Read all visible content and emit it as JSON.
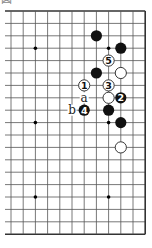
{
  "caption": "図",
  "board": {
    "columns": 12,
    "rows": 19,
    "origin_x": 11,
    "origin_y": 11,
    "spacing_x": 12.2,
    "spacing_y": 12.4,
    "left_open": true,
    "top_edge": true,
    "right_edge": true,
    "bottom_edge": true,
    "colors": {
      "line": "#555555",
      "edge": "#333333",
      "black": "#111111",
      "white": "#ffffff",
      "stone_outline": "#222222"
    },
    "star_points": [
      [
        2,
        3
      ],
      [
        8,
        3
      ],
      [
        2,
        9
      ],
      [
        8,
        9
      ],
      [
        2,
        15
      ],
      [
        8,
        15
      ]
    ],
    "stones": [
      {
        "color": "black",
        "c": 7,
        "r": 2,
        "label": ""
      },
      {
        "color": "black",
        "c": 9,
        "r": 3,
        "label": ""
      },
      {
        "color": "white",
        "c": 8,
        "r": 4,
        "label": "5"
      },
      {
        "color": "black",
        "c": 7,
        "r": 5,
        "label": ""
      },
      {
        "color": "white",
        "c": 9,
        "r": 5,
        "label": ""
      },
      {
        "color": "white",
        "c": 6,
        "r": 6,
        "label": "1"
      },
      {
        "color": "white",
        "c": 8,
        "r": 6,
        "label": "3"
      },
      {
        "color": "white",
        "c": 8,
        "r": 7,
        "label": ""
      },
      {
        "color": "black",
        "c": 9,
        "r": 7,
        "label": "2"
      },
      {
        "color": "black",
        "c": 6,
        "r": 8,
        "label": "4"
      },
      {
        "color": "black",
        "c": 8,
        "r": 8,
        "label": ""
      },
      {
        "color": "black",
        "c": 9,
        "r": 9,
        "label": ""
      },
      {
        "color": "white",
        "c": 9,
        "r": 11,
        "label": ""
      }
    ],
    "letters": [
      {
        "c": 6,
        "r": 7,
        "text": "a"
      },
      {
        "c": 5,
        "r": 8,
        "text": "b"
      }
    ]
  }
}
